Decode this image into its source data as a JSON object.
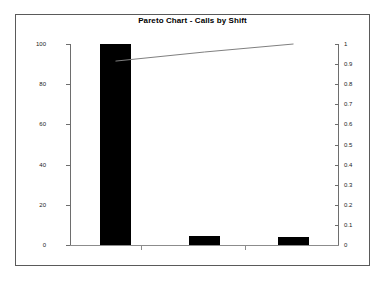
{
  "chart": {
    "title": "Pareto Chart - Calls by Shift"
  },
  "chart_data": {
    "type": "bar",
    "title": "Pareto Chart - Calls by Shift",
    "xlabel": "",
    "ylabel": "",
    "categories": [
      "1",
      "2",
      "3"
    ],
    "values": [
      100,
      4.5,
      4
    ],
    "ylim": [
      0,
      100
    ],
    "y_ticks": [
      0,
      20,
      40,
      60,
      80,
      100
    ],
    "y2_label": "",
    "y2lim": [
      0,
      1
    ],
    "y2_ticks": [
      0,
      0.1,
      0.2,
      0.3,
      0.4,
      0.5,
      0.6,
      0.7,
      0.8,
      0.9,
      1
    ],
    "grid": false,
    "legend": "none",
    "series": [
      {
        "name": "Count",
        "type": "bar",
        "axis": "left",
        "values": [
          100,
          4.5,
          4
        ]
      },
      {
        "name": "Cumulative",
        "type": "line",
        "axis": "right",
        "values": [
          0.915,
          0.96,
          1.0
        ]
      }
    ]
  },
  "axes": {
    "left_ticks": [
      {
        "label": "100",
        "value": 100
      },
      {
        "label": "80",
        "value": 80
      },
      {
        "label": "60",
        "value": 60
      },
      {
        "label": "40",
        "value": 40
      },
      {
        "label": "20",
        "value": 20
      },
      {
        "label": "0",
        "value": 0
      }
    ],
    "right_ticks": [
      {
        "label": "1",
        "value": 1
      },
      {
        "label": "0.9",
        "value": 0.9
      },
      {
        "label": "0.8",
        "value": 0.8
      },
      {
        "label": "0.7",
        "value": 0.7
      },
      {
        "label": "0.6",
        "value": 0.6
      },
      {
        "label": "0.5",
        "value": 0.5
      },
      {
        "label": "0.4",
        "value": 0.4
      },
      {
        "label": "0.3",
        "value": 0.3
      },
      {
        "label": "0.2",
        "value": 0.2
      },
      {
        "label": "0.1",
        "value": 0.1
      },
      {
        "label": "0",
        "value": 0
      }
    ],
    "x_tick_positions": [
      141,
      245
    ]
  },
  "colors": {
    "bar": "#000000",
    "line": "#808080",
    "axis": "#6e6e6e",
    "frame": "#5a5a5a",
    "background": "#ffffff",
    "text": "#1a1a1a"
  }
}
